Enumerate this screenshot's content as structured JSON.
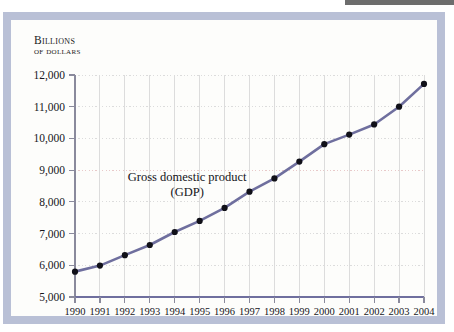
{
  "figure": {
    "axis_caption_line1": "Billions",
    "axis_caption_line2": "of dollars"
  },
  "colors": {
    "frame": "#b9c0d6",
    "page_background": "#fdfdfb",
    "top_fragment": "#6d6d6d",
    "line": "#6f6f9e",
    "marker": "#101018",
    "gridline": "#dcdcdc",
    "gridline_highlight": "#e8c9c9",
    "axis_spine": "#8a8a9c",
    "bottom_spine": "#6f6f9e",
    "text": "#16161c"
  },
  "chart_data": {
    "type": "line",
    "title": "",
    "subtitle": "",
    "xlabel": "",
    "ylabel": "Billions of dollars",
    "annotations": [
      {
        "text_line1": "Gross domestic product",
        "text_line2": "(GDP)",
        "x": 1994.5,
        "y": 8650
      }
    ],
    "legend": [],
    "legend_position": "none",
    "grid": true,
    "xlim": [
      1990,
      2004
    ],
    "ylim": [
      5000,
      12000
    ],
    "ytick_step": 1000,
    "ytick_labels": [
      "12,000",
      "11,000",
      "10,000",
      "9,000",
      "8,000",
      "7,000",
      "6,000",
      "5,000"
    ],
    "ytick_values": [
      12000,
      11000,
      10000,
      9000,
      8000,
      7000,
      6000,
      5000
    ],
    "xtick_labels": [
      "1990",
      "1991",
      "1992",
      "1993",
      "1994",
      "1995",
      "1996",
      "1997",
      "1998",
      "1999",
      "2000",
      "2001",
      "2002",
      "2003",
      "2004"
    ],
    "categories": [
      1990,
      1991,
      1992,
      1993,
      1994,
      1995,
      1996,
      1997,
      1998,
      1999,
      2000,
      2001,
      2002,
      2003,
      2004
    ],
    "series": [
      {
        "name": "Gross domestic product (GDP)",
        "values": [
          5800,
          5990,
          6320,
          6640,
          7050,
          7400,
          7810,
          8320,
          8740,
          9270,
          9820,
          10120,
          10440,
          11000,
          11720
        ]
      }
    ]
  }
}
